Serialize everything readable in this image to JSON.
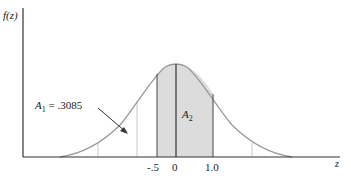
{
  "figure": {
    "y_axis_label": "f(z)",
    "x_axis_label": "z",
    "area_label_1": "A",
    "area_label_1_sub": "1",
    "area_label_1_value": " = .3085",
    "area_label_2": "A",
    "area_label_2_sub": "2",
    "ticks": [
      "-.5",
      "0",
      "1.0"
    ],
    "colors": {
      "curve": "#9a9a9a",
      "shade": "#dcdcdc",
      "axis": "#333333",
      "guide": "#c8c8c8"
    }
  }
}
